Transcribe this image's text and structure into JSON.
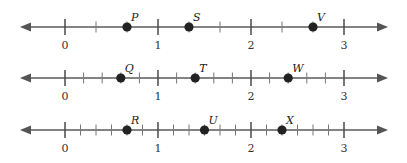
{
  "figure": {
    "unit_px": 93,
    "origin_x": 65,
    "x_start": 20,
    "x_end": 388,
    "number_lines": [
      {
        "y": 27,
        "subdivisions": 3,
        "integer_labels": [
          "0",
          "1",
          "2",
          "3"
        ],
        "points": [
          {
            "label": "P",
            "value": 0.6667
          },
          {
            "label": "S",
            "value": 1.3333
          },
          {
            "label": "V",
            "value": 2.6667
          }
        ]
      },
      {
        "y": 78,
        "subdivisions": 5,
        "integer_labels": [
          "0",
          "1",
          "2",
          "3"
        ],
        "points": [
          {
            "label": "Q",
            "value": 0.6
          },
          {
            "label": "T",
            "value": 1.4
          },
          {
            "label": "W",
            "value": 2.4
          }
        ]
      },
      {
        "y": 130,
        "subdivisions": 6,
        "integer_labels": [
          "0",
          "1",
          "2",
          "3"
        ],
        "points": [
          {
            "label": "R",
            "value": 0.6667
          },
          {
            "label": "U",
            "value": 1.5
          },
          {
            "label": "X",
            "value": 2.3333
          }
        ]
      }
    ]
  },
  "chart_data": {
    "type": "number_line",
    "lines": [
      {
        "tick_interval": "1/3",
        "range": [
          0,
          3
        ],
        "points": {
          "P": 0.667,
          "S": 1.333,
          "V": 2.667
        }
      },
      {
        "tick_interval": "1/5",
        "range": [
          0,
          3
        ],
        "points": {
          "Q": 0.6,
          "T": 1.4,
          "W": 2.4
        }
      },
      {
        "tick_interval": "1/6",
        "range": [
          0,
          3
        ],
        "points": {
          "R": 0.667,
          "U": 1.5,
          "X": 2.333
        }
      }
    ]
  }
}
